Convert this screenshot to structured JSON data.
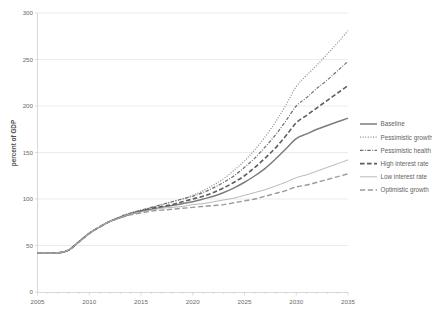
{
  "chart_data": {
    "type": "line",
    "title": "",
    "subtitle": "",
    "xlabel": "",
    "ylabel": "percent of GDP",
    "xlim": [
      2005,
      2035
    ],
    "ylim": [
      0,
      300
    ],
    "grid": true,
    "grid_axis": "y",
    "legend_position": "right",
    "x_ticks": [
      2005,
      2010,
      2015,
      2020,
      2025,
      2030,
      2035
    ],
    "x_tick_labels": [
      "2005",
      "2010",
      "2015",
      "2020",
      "2025",
      "2030",
      "2035"
    ],
    "x_minor_tick_interval": 1,
    "y_ticks": [
      0,
      50,
      100,
      150,
      200,
      250,
      300
    ],
    "y_tick_labels": [
      "0",
      "50",
      "100",
      "150",
      "200",
      "250",
      "300"
    ],
    "x": [
      2005,
      2006,
      2007,
      2008,
      2009,
      2010,
      2011,
      2012,
      2013,
      2014,
      2015,
      2016,
      2017,
      2018,
      2019,
      2020,
      2021,
      2022,
      2023,
      2024,
      2025,
      2026,
      2027,
      2028,
      2029,
      2030,
      2031,
      2032,
      2033,
      2034,
      2035
    ],
    "series": [
      {
        "name": "Baseline",
        "style": "solid",
        "color": "#7d7d7d",
        "width": 1.5,
        "values": [
          42,
          42,
          42,
          45,
          54,
          63,
          70,
          76,
          80,
          84,
          87,
          89,
          91,
          93,
          95,
          97,
          100,
          103,
          107,
          112,
          118,
          125,
          133,
          143,
          154,
          165,
          170,
          175,
          179,
          183,
          187
        ]
      },
      {
        "name": "Pessimistic growth",
        "style": "dotted",
        "color": "#8a8a8a",
        "width": 1.2,
        "values": [
          42,
          42,
          42,
          45,
          54,
          63,
          70,
          76,
          81,
          85,
          88,
          91,
          94,
          97,
          100,
          104,
          109,
          115,
          122,
          131,
          141,
          153,
          167,
          183,
          201,
          221,
          233,
          244,
          256,
          268,
          281
        ]
      },
      {
        "name": "Pessimistic health",
        "style": "dash-dot",
        "color": "#6f6f6f",
        "width": 1.2,
        "values": [
          42,
          42,
          42,
          45,
          54,
          63,
          70,
          76,
          81,
          85,
          88,
          91,
          94,
          97,
          100,
          103,
          107,
          112,
          118,
          125,
          134,
          144,
          156,
          169,
          184,
          200,
          209,
          219,
          228,
          238,
          248
        ]
      },
      {
        "name": "High interest rate",
        "style": "long-dash",
        "color": "#5d5d5d",
        "width": 1.6,
        "values": [
          42,
          42,
          42,
          45,
          54,
          63,
          70,
          76,
          80,
          84,
          87,
          90,
          92,
          94,
          97,
          100,
          103,
          107,
          112,
          118,
          125,
          134,
          144,
          155,
          168,
          182,
          190,
          198,
          206,
          214,
          222
        ]
      },
      {
        "name": "Low interest rate",
        "style": "solid-light",
        "color": "#b9b9b9",
        "width": 1.0,
        "values": [
          42,
          42,
          42,
          45,
          54,
          63,
          70,
          76,
          80,
          84,
          86,
          88,
          90,
          91,
          92,
          94,
          95,
          97,
          99,
          101,
          104,
          107,
          110,
          114,
          118,
          123,
          126,
          130,
          134,
          138,
          142
        ]
      },
      {
        "name": "Optimistic growth",
        "style": "long-dash-light",
        "color": "#9a9a9a",
        "width": 1.4,
        "values": [
          42,
          42,
          42,
          45,
          54,
          63,
          70,
          76,
          80,
          83,
          85,
          87,
          88,
          89,
          90,
          91,
          92,
          93,
          94,
          96,
          98,
          100,
          103,
          106,
          109,
          113,
          115,
          118,
          121,
          124,
          127
        ]
      }
    ]
  },
  "legend": {
    "items": [
      {
        "label": "Baseline"
      },
      {
        "label": "Pessimistic growth"
      },
      {
        "label": "Pessimistic health"
      },
      {
        "label": "High interest rate"
      },
      {
        "label": "Low interest rate"
      },
      {
        "label": "Optimistic growth"
      }
    ]
  }
}
